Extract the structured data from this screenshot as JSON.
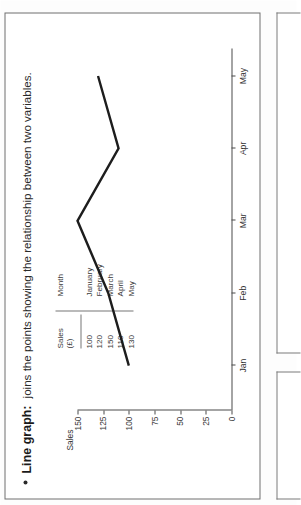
{
  "page": {
    "bullet_lead": "Line graph:",
    "bullet_rest": "joins the points showing the relationship between two variables."
  },
  "table": {
    "header_value": "Sales",
    "header_unit": "(£)",
    "header_category": "Month",
    "rows": [
      {
        "value": "100",
        "month": "January"
      },
      {
        "value": "120",
        "month": "February"
      },
      {
        "value": "150",
        "month": "March"
      },
      {
        "value": "110",
        "month": "April"
      },
      {
        "value": "130",
        "month": "May"
      }
    ]
  },
  "chart_data": {
    "type": "line",
    "title": "",
    "xlabel": "",
    "ylabel": "Sales",
    "categories": [
      "Jan",
      "Feb",
      "Mar",
      "Apr",
      "May"
    ],
    "values": [
      100,
      120,
      150,
      110,
      130
    ],
    "yticks": [
      "150",
      "125",
      "100",
      "75",
      "50",
      "25",
      "0"
    ],
    "ytick_values": [
      150,
      125,
      100,
      75,
      50,
      25,
      0
    ],
    "ylim": [
      0,
      150
    ],
    "grid": false,
    "legend": "none",
    "line_color": "#1d1d1d"
  },
  "colors": {
    "page_background": "#ffffff",
    "border": "#6f6f6f",
    "text": "#1a1a1a",
    "axis": "#4a4a4a"
  }
}
